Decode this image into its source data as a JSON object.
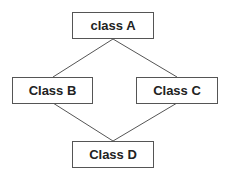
{
  "diagram": {
    "type": "class-hierarchy",
    "nodes": [
      {
        "id": "A",
        "label": "class A"
      },
      {
        "id": "B",
        "label": "Class B"
      },
      {
        "id": "C",
        "label": "Class C"
      },
      {
        "id": "D",
        "label": "Class D"
      }
    ],
    "edges": [
      {
        "from": "A",
        "to": "B"
      },
      {
        "from": "A",
        "to": "C"
      },
      {
        "from": "B",
        "to": "D"
      },
      {
        "from": "C",
        "to": "D"
      }
    ]
  },
  "colors": {
    "line": "#555555",
    "text": "#222222",
    "background": "#ffffff"
  }
}
